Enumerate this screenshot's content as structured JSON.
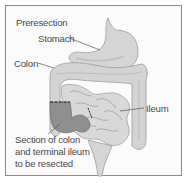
{
  "figure": {
    "title": "Preresection",
    "labels": {
      "stomach": "Stomach",
      "colon": "Colon",
      "ileum": "Ileum",
      "resected_line1": "Section of colon",
      "resected_line2": "and terminal ileum",
      "resected_line3": "to be resected"
    },
    "colors": {
      "organ_fill": "#d9d9d9",
      "organ_shade": "#bdbdbd",
      "resected_fill": "#8c8c8c",
      "outline": "#9a9a9a",
      "text": "#4a4a4a",
      "border": "#8a8a8a"
    }
  }
}
